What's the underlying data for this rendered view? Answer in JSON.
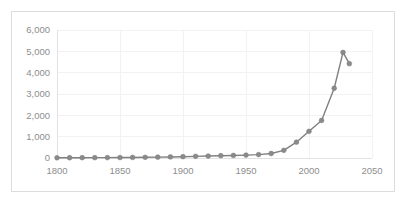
{
  "chart_data": {
    "type": "line",
    "title": "",
    "subtitle": "",
    "xlabel": "",
    "ylabel": "",
    "xlim": [
      1800,
      2050
    ],
    "ylim": [
      0,
      6000
    ],
    "grid": true,
    "legend": false,
    "legend_position": "none",
    "x_ticks": [
      1800,
      1850,
      1900,
      1950,
      2000,
      2050
    ],
    "x_tick_labels": [
      "1800",
      "1850",
      "1900",
      "1950",
      "2000",
      "2050"
    ],
    "y_ticks": [
      0,
      1000,
      2000,
      3000,
      4000,
      5000,
      6000
    ],
    "y_tick_labels": [
      "0",
      "1,000",
      "2,000",
      "3,000",
      "4,000",
      "5,000",
      "6,000"
    ],
    "series": [
      {
        "name": "series-1",
        "color": "#808080",
        "marker": "circle",
        "x": [
          1800,
          1810,
          1820,
          1830,
          1840,
          1850,
          1860,
          1870,
          1880,
          1890,
          1900,
          1910,
          1920,
          1930,
          1940,
          1950,
          1960,
          1970,
          1980,
          1990,
          2000,
          2010,
          2020,
          2027,
          2032
        ],
        "values": [
          10,
          12,
          14,
          16,
          18,
          22,
          26,
          32,
          40,
          50,
          62,
          78,
          92,
          108,
          120,
          135,
          160,
          210,
          360,
          740,
          1250,
          1760,
          3270,
          4950,
          4420
        ]
      }
    ]
  },
  "chart_frame": {
    "border_color": "#dcdcdc",
    "background": "#ffffff"
  },
  "style": {
    "tick_color": "#8d8d8d",
    "grid_color": "#f2f2f2",
    "axis_color": "#e2e2e2",
    "series_color": "#808080",
    "marker_color": "#8a8a8a"
  }
}
